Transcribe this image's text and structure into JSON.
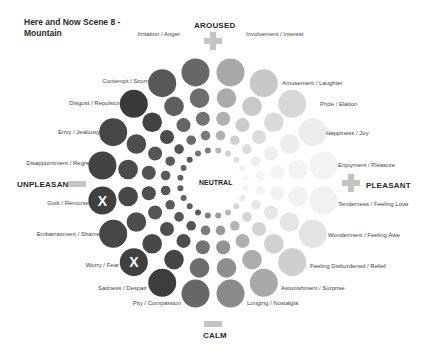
{
  "title": "Here and Now Scene 8 - Mountain",
  "title_lines": [
    "Here and Now Scene 8 -",
    "Mountain"
  ],
  "axes": {
    "top": "AROUSED",
    "bottom": "CALM",
    "left": "UNPLEASANT",
    "right": "PLEASANT",
    "center": "NEUTRAL"
  },
  "axis_icons": {
    "top": "plus-icon",
    "right": "plus-icon",
    "left": "minus-icon",
    "bottom": "minus-icon"
  },
  "emotions": [
    {
      "label": "Involvement / Interest",
      "side": "right",
      "color": "#a8a8a8",
      "selected": false
    },
    {
      "label": "Amusement / Laughter",
      "side": "right",
      "color": "#c8c8c8",
      "selected": false
    },
    {
      "label": "Pride / Elation",
      "side": "right",
      "color": "#d8d8d8",
      "selected": false
    },
    {
      "label": "Happiness / Joy",
      "side": "right",
      "color": "#ececec",
      "selected": false
    },
    {
      "label": "Enjoyment / Pleasure",
      "side": "right",
      "color": "#f3f3f3",
      "selected": false
    },
    {
      "label": "Tenderness / Feeling Love",
      "side": "right",
      "color": "#f1f1f1",
      "selected": false
    },
    {
      "label": "Wonderment / Feeling Awe",
      "side": "right",
      "color": "#e4e4e4",
      "selected": false
    },
    {
      "label": "Feeling Disburdened / Relief",
      "side": "right",
      "color": "#cfcfcf",
      "selected": false
    },
    {
      "label": "Astonishment / Surprise",
      "side": "right",
      "color": "#a9a9a9",
      "selected": false
    },
    {
      "label": "Longing / Nostalgia",
      "side": "right",
      "color": "#8a8a8a",
      "selected": false
    },
    {
      "label": "Pity / Compassion",
      "side": "left",
      "color": "#676767",
      "selected": false
    },
    {
      "label": "Sadness / Despair",
      "side": "left",
      "color": "#3d3d3d",
      "selected": false
    },
    {
      "label": "Worry / Fear",
      "side": "left",
      "color": "#404040",
      "selected": true
    },
    {
      "label": "Embarrasment / Shame",
      "side": "left",
      "color": "#464646",
      "selected": false
    },
    {
      "label": "Guilt / Remorse",
      "side": "left",
      "color": "#404040",
      "selected": true
    },
    {
      "label": "Disappointment / Regret",
      "side": "left",
      "color": "#434343",
      "selected": false
    },
    {
      "label": "Envy / Jealousy",
      "side": "left",
      "color": "#464646",
      "selected": false
    },
    {
      "label": "Disgust / Repulsion",
      "side": "left",
      "color": "#3a3a3a",
      "selected": false
    },
    {
      "label": "Contempt / Scorn",
      "side": "left",
      "color": "#585858",
      "selected": false
    },
    {
      "label": "Irritation / Anger",
      "side": "left",
      "color": "#676767",
      "selected": false
    }
  ],
  "selection_mark": "X",
  "rings": 5,
  "wheel": {
    "cx": 213,
    "cy": 183
  }
}
